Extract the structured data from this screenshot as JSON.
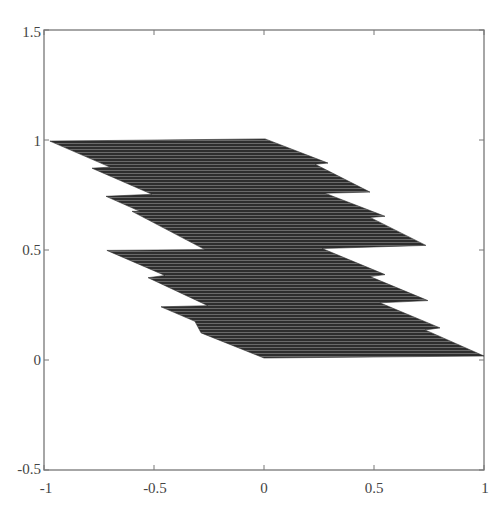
{
  "chart_data": {
    "type": "area",
    "title": "",
    "xlabel": "",
    "ylabel": "",
    "xlim": [
      -1,
      1
    ],
    "ylim": [
      -0.5,
      1.5
    ],
    "x_ticks": [
      "-1",
      "-0.5",
      "0",
      "0.5",
      "1"
    ],
    "y_ticks": [
      "-0.5",
      "0",
      "0.5",
      "1",
      "1.5"
    ],
    "grid": false,
    "legend": null,
    "fill_color": "#3a3a3a",
    "outline": [
      {
        "x": -0.973,
        "y": 0.995
      },
      {
        "x": 0.005,
        "y": 1.005
      },
      {
        "x": 0.291,
        "y": 0.895
      },
      {
        "x": 0.232,
        "y": 0.89
      },
      {
        "x": 0.482,
        "y": 0.763
      },
      {
        "x": 0.277,
        "y": 0.758
      },
      {
        "x": 0.55,
        "y": 0.653
      },
      {
        "x": 0.482,
        "y": 0.648
      },
      {
        "x": 0.736,
        "y": 0.521
      },
      {
        "x": 0.264,
        "y": 0.507
      },
      {
        "x": 0.55,
        "y": 0.388
      },
      {
        "x": 0.482,
        "y": 0.379
      },
      {
        "x": 0.745,
        "y": 0.27
      },
      {
        "x": 0.527,
        "y": 0.26
      },
      {
        "x": 0.8,
        "y": 0.146
      },
      {
        "x": 0.732,
        "y": 0.137
      },
      {
        "x": 1.0,
        "y": 0.018
      },
      {
        "x": 0.0,
        "y": 0.009
      },
      {
        "x": -0.286,
        "y": 0.123
      },
      {
        "x": -0.314,
        "y": 0.176
      },
      {
        "x": -0.468,
        "y": 0.242
      },
      {
        "x": -0.255,
        "y": 0.247
      },
      {
        "x": -0.527,
        "y": 0.374
      },
      {
        "x": -0.45,
        "y": 0.384
      },
      {
        "x": -0.714,
        "y": 0.498
      },
      {
        "x": -0.268,
        "y": 0.502
      },
      {
        "x": -0.6,
        "y": 0.676
      },
      {
        "x": -0.564,
        "y": 0.676
      },
      {
        "x": -0.718,
        "y": 0.744
      },
      {
        "x": -0.509,
        "y": 0.753
      },
      {
        "x": -0.782,
        "y": 0.872
      },
      {
        "x": -0.7,
        "y": 0.877
      }
    ]
  }
}
